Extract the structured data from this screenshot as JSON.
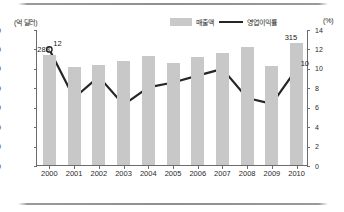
{
  "chart_data": {
    "type": "bar",
    "title": "",
    "categories": [
      "2000",
      "2001",
      "2002",
      "2003",
      "2004",
      "2005",
      "2006",
      "2007",
      "2008",
      "2009",
      "2010"
    ],
    "xlabel": "",
    "grid": false,
    "legend_position": "top-center",
    "axes": {
      "left": {
        "unit_label": "(억 달러)",
        "ticks": [
          "0",
          "50",
          "100",
          "150",
          "200",
          "250",
          "300",
          "350"
        ],
        "tick_values": [
          0,
          50,
          100,
          150,
          200,
          250,
          300,
          350
        ],
        "ylim": [
          0,
          350
        ],
        "ylabel": "억 달러"
      },
      "right": {
        "unit_label": "(%)",
        "ticks": [
          "0",
          "2",
          "4",
          "6",
          "8",
          "10",
          "12",
          "14"
        ],
        "tick_values": [
          0,
          2,
          4,
          6,
          8,
          10,
          12,
          14
        ],
        "ylim": [
          0,
          14
        ],
        "ylabel": "%"
      }
    },
    "series": [
      {
        "name": "매출액",
        "type": "bar",
        "axis": "left",
        "color": "#c8c8c8",
        "values": [
          283,
          252,
          258,
          268,
          280,
          263,
          278,
          288,
          303,
          255,
          315
        ],
        "point_labels": [
          "283",
          "",
          "",
          "",
          "",
          "",
          "",
          "",
          "",
          "",
          "315"
        ]
      },
      {
        "name": "영업이익률",
        "type": "line",
        "axis": "right",
        "color": "#262626",
        "values": [
          12.0,
          7.0,
          9.2,
          6.3,
          8.1,
          8.6,
          9.3,
          10.0,
          7.0,
          6.4,
          10.0
        ],
        "point_labels": [
          "12",
          "",
          "",
          "",
          "",
          "",
          "",
          "",
          "",
          "",
          "10"
        ]
      }
    ]
  },
  "legend": {
    "items": [
      {
        "label": "매출액",
        "marker": "bar-swatch"
      },
      {
        "label": "영업이익률",
        "marker": "line-swatch"
      }
    ]
  },
  "units": {
    "left": "(억 달러)",
    "right": "(%)"
  }
}
